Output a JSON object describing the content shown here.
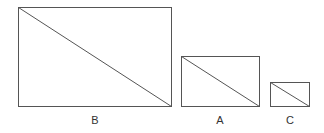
{
  "diagram": {
    "stroke_color": "#555555",
    "shapes": [
      {
        "label": "B",
        "x": 18,
        "y": 7,
        "w": 153,
        "h": 99,
        "label_x": 85,
        "label_y": 114
      },
      {
        "label": "A",
        "x": 181,
        "y": 56,
        "w": 78,
        "h": 50,
        "label_x": 210,
        "label_y": 114
      },
      {
        "label": "C",
        "x": 270,
        "y": 82,
        "w": 39,
        "h": 24,
        "label_x": 280,
        "label_y": 114
      }
    ]
  }
}
